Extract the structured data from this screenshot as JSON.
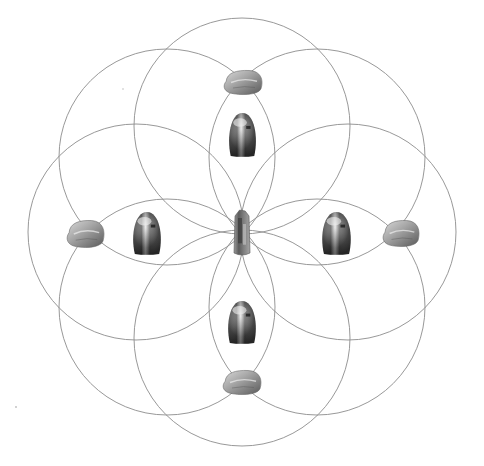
{
  "diagram": {
    "line_color": "#8c8c8c",
    "background": "#ffffff",
    "center": [
      242,
      232
    ],
    "circle_radius": 108,
    "circle_offset": 106,
    "circle_count": 8,
    "circle_angles_deg": [
      0,
      45,
      90,
      135,
      180,
      225,
      270,
      315
    ],
    "center_crystal": {
      "name": "quartz-point",
      "x": 234,
      "y": 210,
      "w": 16,
      "h": 46
    },
    "dome_stones": [
      {
        "position": "top",
        "x": 227,
        "y": 113,
        "w": 31,
        "h": 43
      },
      {
        "position": "left",
        "x": 131,
        "y": 212,
        "w": 32,
        "h": 42
      },
      {
        "position": "right",
        "x": 320,
        "y": 212,
        "w": 33,
        "h": 42
      },
      {
        "position": "bottom",
        "x": 226,
        "y": 301,
        "w": 32,
        "h": 42
      }
    ],
    "tumbled_stones": [
      {
        "position": "top",
        "x": 223,
        "y": 70,
        "w": 40,
        "h": 25
      },
      {
        "position": "left",
        "x": 66,
        "y": 220,
        "w": 39,
        "h": 28
      },
      {
        "position": "right",
        "x": 382,
        "y": 220,
        "w": 38,
        "h": 27
      },
      {
        "position": "bottom",
        "x": 222,
        "y": 370,
        "w": 40,
        "h": 25
      }
    ]
  }
}
